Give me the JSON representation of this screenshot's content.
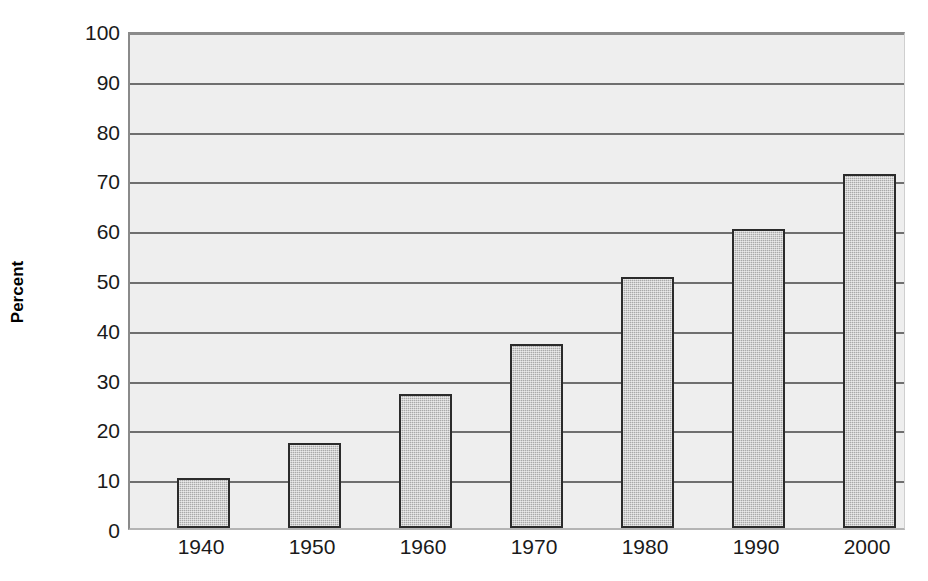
{
  "chart_data": {
    "type": "bar",
    "title": "",
    "xlabel": "",
    "ylabel": "Percent",
    "categories": [
      "1940",
      "1950",
      "1960",
      "1970",
      "1980",
      "1990",
      "2000"
    ],
    "values": [
      10,
      17,
      27,
      37,
      50.5,
      60,
      71
    ],
    "series": [
      {
        "name": "Percent",
        "values": [
          10,
          17,
          27,
          37,
          50.5,
          60,
          71
        ]
      }
    ],
    "ylim": [
      0,
      100
    ],
    "ytick_labels": [
      "0",
      "10",
      "20",
      "30",
      "40",
      "50",
      "60",
      "70",
      "80",
      "90",
      "100"
    ],
    "ytick_values": [
      0,
      10,
      20,
      30,
      40,
      50,
      60,
      70,
      80,
      90,
      100
    ],
    "grid": true,
    "grid_axis": "y",
    "legend": false,
    "legend_position": "none",
    "bar_fill_color": "#a9a9a9",
    "bar_edge_color": "#2b2b2b",
    "plot_background_color": "#eeeeee",
    "gridline_color": "#6e6e6e",
    "text_color": "#1a1a1a"
  }
}
